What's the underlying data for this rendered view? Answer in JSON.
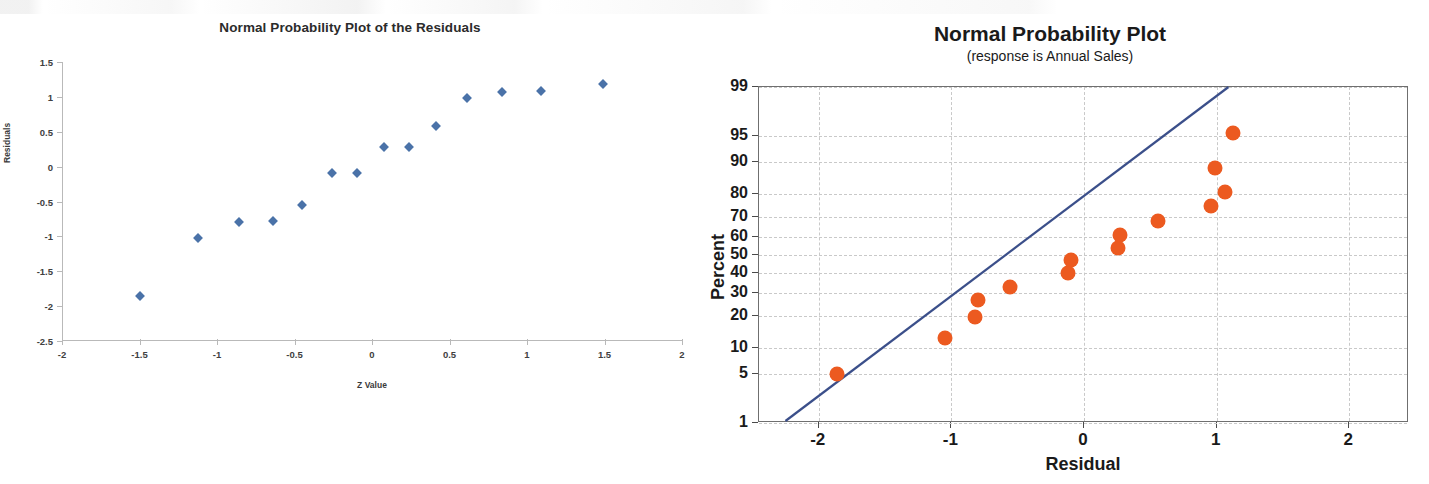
{
  "chart_data": [
    {
      "id": "left",
      "type": "scatter",
      "title": "Normal Probability Plot of the Residuals",
      "xlabel": "Z Value",
      "ylabel": "Residuals",
      "xlim": [
        -2,
        2
      ],
      "ylim": [
        -2.5,
        1.5
      ],
      "xticks": [
        "-2",
        "-1.5",
        "-1",
        "-0.5",
        "0",
        "0.5",
        "1",
        "1.5",
        "2"
      ],
      "xtick_values": [
        -2,
        -1.5,
        -1,
        -0.5,
        0,
        0.5,
        1,
        1.5,
        2
      ],
      "yticks": [
        "1.5",
        "1",
        "0.5",
        "0",
        "-0.5",
        "-1",
        "-1.5",
        "-2",
        "-2.5"
      ],
      "ytick_values": [
        1.5,
        1,
        0.5,
        0,
        -0.5,
        -1,
        -1.5,
        -2,
        -2.5
      ],
      "grid": false,
      "legend": "none",
      "marker": "diamond",
      "marker_color": "#4a72a8",
      "x": [
        -1.5,
        -1.12,
        -0.86,
        -0.64,
        -0.45,
        -0.26,
        -0.1,
        0.08,
        0.24,
        0.41,
        0.61,
        0.84,
        1.09,
        1.49
      ],
      "y": [
        -1.86,
        -1.03,
        -0.79,
        -0.78,
        -0.55,
        -0.09,
        -0.09,
        0.28,
        0.28,
        0.58,
        0.98,
        1.07,
        1.08,
        1.18
      ],
      "points": [
        {
          "x": -1.5,
          "y": -1.86
        },
        {
          "x": -1.12,
          "y": -1.03
        },
        {
          "x": -0.86,
          "y": -0.79
        },
        {
          "x": -0.64,
          "y": -0.78
        },
        {
          "x": -0.45,
          "y": -0.55
        },
        {
          "x": -0.26,
          "y": -0.09
        },
        {
          "x": -0.1,
          "y": -0.09
        },
        {
          "x": 0.08,
          "y": 0.28
        },
        {
          "x": 0.24,
          "y": 0.28
        },
        {
          "x": 0.41,
          "y": 0.58
        },
        {
          "x": 0.61,
          "y": 0.98
        },
        {
          "x": 0.84,
          "y": 1.07
        },
        {
          "x": 1.09,
          "y": 1.08
        },
        {
          "x": 1.49,
          "y": 1.18
        }
      ]
    },
    {
      "id": "right",
      "type": "scatter",
      "title": "Normal Probability Plot",
      "subtitle": "(response is Annual Sales)",
      "xlabel": "Residual",
      "ylabel": "Percent",
      "xlim": [
        -2.45,
        2.45
      ],
      "ylim": [
        1,
        99
      ],
      "yscale": "normal-probability",
      "xticks": [
        "-2",
        "-1",
        "0",
        "1",
        "2"
      ],
      "xtick_values": [
        -2,
        -1,
        0,
        1,
        2
      ],
      "yticks": [
        "99",
        "95",
        "90",
        "80",
        "70",
        "60",
        "50",
        "40",
        "30",
        "20",
        "10",
        "5",
        "1"
      ],
      "ytick_values": [
        99,
        95,
        90,
        80,
        70,
        60,
        50,
        40,
        30,
        20,
        10,
        5,
        1
      ],
      "grid": true,
      "legend": "none",
      "marker": "circle",
      "marker_color": "#ec5a20",
      "fit_line_color": "#3b4f8a",
      "fit_line": {
        "x0": -2.25,
        "y0": 1,
        "x1": 1.1,
        "y1": 99
      },
      "points": [
        {
          "x": -1.86,
          "y": 5
        },
        {
          "x": -1.05,
          "y": 12.5
        },
        {
          "x": -0.82,
          "y": 19.5
        },
        {
          "x": -0.8,
          "y": 26.5
        },
        {
          "x": -0.56,
          "y": 33
        },
        {
          "x": -0.12,
          "y": 40
        },
        {
          "x": -0.1,
          "y": 47
        },
        {
          "x": 0.26,
          "y": 54
        },
        {
          "x": 0.27,
          "y": 61
        },
        {
          "x": 0.56,
          "y": 68
        },
        {
          "x": 0.96,
          "y": 75
        },
        {
          "x": 1.06,
          "y": 81
        },
        {
          "x": 0.99,
          "y": 88.5
        },
        {
          "x": 1.12,
          "y": 95.5
        }
      ]
    }
  ],
  "left": {
    "title": "Normal Probability Plot of the Residuals",
    "xlabel": "Z Value",
    "ylabel": "Residuals"
  },
  "right": {
    "title": "Normal Probability Plot",
    "subtitle": "(response is Annual Sales)",
    "xlabel": "Residual",
    "ylabel": "Percent"
  }
}
